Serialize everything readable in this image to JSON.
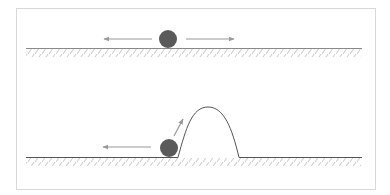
{
  "diagram": {
    "colors": {
      "frame": "#d8d8d8",
      "ground": "#8a8a8a",
      "hatch": "#b8b8b8",
      "ball": "#5a5a5a",
      "arrow": "#9a9a9a",
      "hump": "#333333"
    },
    "panels": [
      {
        "name": "flat-ground",
        "ball": {
          "cx": 168,
          "cy": 39,
          "r": 9
        },
        "arrows": [
          {
            "direction": "left",
            "from": [
              152,
              39
            ],
            "to": [
              104,
              39
            ]
          },
          {
            "direction": "right",
            "from": [
              186,
              39
            ],
            "to": [
              234,
              39
            ]
          }
        ]
      },
      {
        "name": "ground-with-hump",
        "ball": {
          "cx": 169,
          "cy": 148,
          "r": 9
        },
        "arrows": [
          {
            "direction": "left",
            "from": [
              151,
              147
            ],
            "to": [
              103,
              147
            ]
          },
          {
            "direction": "up-right",
            "from": [
              174,
              136
            ],
            "to": [
              183,
              119
            ]
          }
        ],
        "hump": {
          "start_x": 178,
          "end_x": 240,
          "peak": [
            208,
            107
          ],
          "base_y": 157
        }
      }
    ]
  }
}
